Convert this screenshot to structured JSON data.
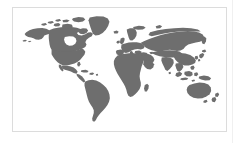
{
  "figure": {
    "kind": "world-map",
    "projection": "robinson",
    "caption": ""
  },
  "frame": {
    "border_color": "#dcdcdc",
    "background_color": "#ffffff",
    "padding_color": "#ffffff"
  },
  "map": {
    "land_color": "#6e6e6e",
    "ocean_color": "#ffffff",
    "border_color": "#dcdcdc",
    "shows_antarctica": false,
    "shows_graticule": false,
    "shows_labels": false,
    "continents": [
      {
        "name": "North America"
      },
      {
        "name": "South America"
      },
      {
        "name": "Greenland"
      },
      {
        "name": "Europe"
      },
      {
        "name": "Africa"
      },
      {
        "name": "Asia"
      },
      {
        "name": "Australia"
      },
      {
        "name": "New Zealand"
      }
    ]
  },
  "page": {
    "background_color": "#ffffff",
    "rule_color": "#f0f0f0"
  }
}
